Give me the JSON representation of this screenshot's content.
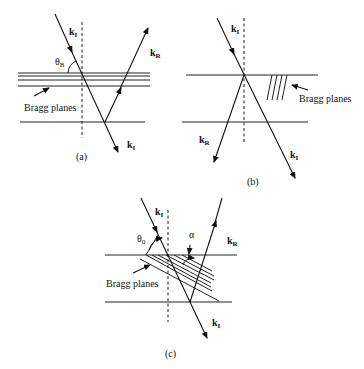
{
  "panels": {
    "a": {
      "caption": "(a)",
      "ki_top_label": "k",
      "ki_top_sub": "I",
      "kr_label": "k",
      "kr_sub": "R",
      "ki_bottom_label": "k",
      "ki_bottom_sub": "I",
      "angle_label": "θ",
      "angle_sub": "B",
      "bragg_label": "Bragg planes"
    },
    "b": {
      "caption": "(b)",
      "ki_top_label": "k",
      "ki_top_sub": "I",
      "kr_label": "k",
      "kr_sub": "R",
      "ki_bottom_label": "k",
      "ki_bottom_sub": "I",
      "bragg_label": "Bragg planes"
    },
    "c": {
      "caption": "(c)",
      "ki_top_label": "k",
      "ki_top_sub": "I",
      "kr_label": "k",
      "kr_sub": "R",
      "ki_bottom_label": "k",
      "ki_bottom_sub": "I",
      "angle_label": "θ",
      "angle_sub": "0",
      "alpha_label": "α",
      "bragg_label": "Bragg planes"
    }
  }
}
